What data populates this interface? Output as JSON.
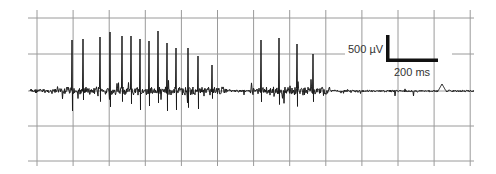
{
  "chart_data": {
    "type": "line",
    "title": "",
    "xlabel": "",
    "ylabel": "",
    "grid": true,
    "legend": null,
    "scale_bar": {
      "vertical_label": "500 µV",
      "horizontal_label": "200 ms"
    },
    "baseline_px": 91,
    "spikes": [
      {
        "x": 72,
        "peak": 40
      },
      {
        "x": 83,
        "peak": 39
      },
      {
        "x": 100,
        "peak": 37
      },
      {
        "x": 110,
        "peak": 32
      },
      {
        "x": 122,
        "peak": 36
      },
      {
        "x": 131,
        "peak": 36
      },
      {
        "x": 140,
        "peak": 39
      },
      {
        "x": 149,
        "peak": 41
      },
      {
        "x": 158,
        "peak": 31
      },
      {
        "x": 167,
        "peak": 43
      },
      {
        "x": 176,
        "peak": 48
      },
      {
        "x": 188,
        "peak": 48
      },
      {
        "x": 198,
        "peak": 56
      },
      {
        "x": 212,
        "peak": 65
      },
      {
        "x": 261,
        "peak": 40
      },
      {
        "x": 279,
        "peak": 38
      },
      {
        "x": 297,
        "peak": 44
      },
      {
        "x": 313,
        "peak": 54
      }
    ],
    "burst_ranges_px": [
      [
        60,
        225
      ],
      [
        250,
        330
      ]
    ],
    "trace_range_px": [
      30,
      474
    ],
    "late_bump": {
      "x": 442,
      "peak": 84
    }
  },
  "colors": {
    "background": "#ffffff",
    "grid": "#9a9a9a",
    "trace": "#1a1a1a",
    "scale_bar": "#111111"
  }
}
